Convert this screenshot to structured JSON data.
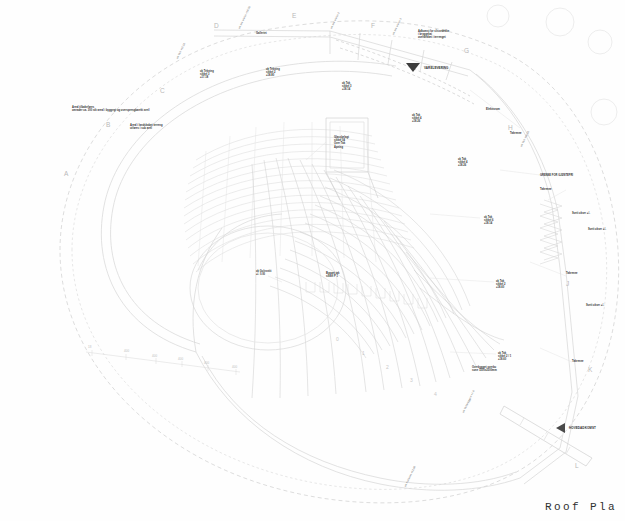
{
  "sheet": {
    "title": "Roof Pla",
    "background": "#fefefe",
    "line_color": "#d9d9d9",
    "line_color_strong": "#bdbdbd",
    "dash_color": "#cfcfcf",
    "text_color": "#2e2e2e"
  },
  "grid_letters": [
    {
      "label": "A",
      "x": 64,
      "y": 170
    },
    {
      "label": "B",
      "x": 106,
      "y": 121
    },
    {
      "label": "C",
      "x": 160,
      "y": 87
    },
    {
      "label": "D",
      "x": 214,
      "y": 22
    },
    {
      "label": "E",
      "x": 292,
      "y": 12
    },
    {
      "label": "F",
      "x": 371,
      "y": 22
    },
    {
      "label": "G",
      "x": 464,
      "y": 47
    },
    {
      "label": "H",
      "x": 508,
      "y": 124
    },
    {
      "label": "J",
      "x": 566,
      "y": 280
    },
    {
      "label": "K",
      "x": 588,
      "y": 366
    },
    {
      "label": "L",
      "x": 575,
      "y": 462
    }
  ],
  "seat_numbers": [
    {
      "label": "0",
      "x": 336,
      "y": 336
    },
    {
      "label": "1",
      "x": 362,
      "y": 350
    },
    {
      "label": "2",
      "x": 386,
      "y": 364
    },
    {
      "label": "3",
      "x": 410,
      "y": 377
    },
    {
      "label": "4",
      "x": 434,
      "y": 391
    }
  ],
  "tick_numbers": [
    {
      "label": "18",
      "x": 88,
      "y": 346
    },
    {
      "label": "400",
      "x": 124,
      "y": 350
    },
    {
      "label": "400",
      "x": 152,
      "y": 355
    },
    {
      "label": "400",
      "x": 178,
      "y": 358
    },
    {
      "label": "400",
      "x": 204,
      "y": 362
    },
    {
      "label": "400",
      "x": 232,
      "y": 366
    }
  ],
  "annotations": [
    {
      "id": "roof-note-c1",
      "x": 200,
      "y": 70,
      "text": "uk Tekning\nsikkel 3\n+17.18",
      "style": "note"
    },
    {
      "id": "roof-note-c2",
      "x": 266,
      "y": 68,
      "text": "uk Tekning\nsikkel 2\n+18.80",
      "style": "note"
    },
    {
      "id": "roof-note-f1",
      "x": 342,
      "y": 82,
      "text": "ok Tak\nsikkel 3\n+18.14",
      "style": "note"
    },
    {
      "id": "roof-note-g1",
      "x": 412,
      "y": 114,
      "text": "ok Tak\nsikkel 4\n+18.26",
      "style": "note"
    },
    {
      "id": "roof-note-g2",
      "x": 458,
      "y": 158,
      "text": "ok Tak\nsikkel 4\n+18.26",
      "style": "note"
    },
    {
      "id": "roof-note-j1",
      "x": 484,
      "y": 216,
      "text": "ok Tak\nsikkel 6\n+18.14",
      "style": "note"
    },
    {
      "id": "roof-note-j2",
      "x": 496,
      "y": 280,
      "text": "ok Tak\nsikkel 2\n+18.60",
      "style": "note"
    },
    {
      "id": "roof-note-k1",
      "x": 498,
      "y": 352,
      "text": "ok Tak\nsikkel 2 / 1\n+18.60",
      "style": "note"
    },
    {
      "id": "site-note-left",
      "x": 72,
      "y": 106,
      "text": "Areal tilbakeføres\nomrader ca. 300 stk areal i byggegt og oversprengbarekt areil",
      "style": "note"
    },
    {
      "id": "site-note-left2",
      "x": 130,
      "y": 124,
      "text": "Areal i landskabet terreng\nutføres i sub areil",
      "style": "note"
    },
    {
      "id": "roof-box-note",
      "x": 334,
      "y": 136,
      "text": "Glassbelagt\nsikkel 04\nOver Tak\nÅpning",
      "style": "note"
    },
    {
      "id": "center-note",
      "x": 256,
      "y": 270,
      "text": "ok Gulvsnitt\n+/- 0.00",
      "style": "note"
    },
    {
      "id": "stage-note",
      "x": 326,
      "y": 272,
      "text": "Bygget tak\nsikkel P 1",
      "style": "note"
    },
    {
      "id": "gjeste-note",
      "x": 540,
      "y": 174,
      "text": "GRENSE FOR GJØSTEFRI",
      "style": "note"
    },
    {
      "id": "takrenne-1",
      "x": 510,
      "y": 132,
      "text": "Takrenne",
      "style": "note"
    },
    {
      "id": "takrenne-2",
      "x": 540,
      "y": 188,
      "text": "Takrenne",
      "style": "note"
    },
    {
      "id": "takrenne-3",
      "x": 566,
      "y": 272,
      "text": "Takrenne",
      "style": "note"
    },
    {
      "id": "takrenne-4",
      "x": 572,
      "y": 360,
      "text": "Takrenne",
      "style": "note"
    },
    {
      "id": "sveit-1",
      "x": 572,
      "y": 212,
      "text": "Sveit okser +/-",
      "style": "note"
    },
    {
      "id": "sveit-2",
      "x": 588,
      "y": 228,
      "text": "Sveit okser +/-",
      "style": "note"
    },
    {
      "id": "sveit-3",
      "x": 586,
      "y": 304,
      "text": "Sveit okser +/-",
      "style": "note"
    },
    {
      "id": "overbygget",
      "x": 472,
      "y": 366,
      "text": "Overbygget overbu\nsone 1500x2500mm",
      "style": "note"
    },
    {
      "id": "galleri-note",
      "x": 256,
      "y": 32,
      "text": "Galleriet",
      "style": "note"
    },
    {
      "id": "elevator-note",
      "x": 486,
      "y": 108,
      "text": "Elektrorom",
      "style": "note"
    },
    {
      "id": "adkomst-note",
      "x": 418,
      "y": 30,
      "text": "Adkomst for slissedekke\ni bryggekai\noverdekket i terrenget",
      "style": "note"
    }
  ],
  "vertical_labels": [
    {
      "id": "v-left-1",
      "x": 176,
      "y": 58,
      "text": "ok Tak +17.10"
    },
    {
      "id": "v-d-1",
      "x": 238,
      "y": 28,
      "text": "ok tak sikkel +18.70"
    },
    {
      "id": "v-f-1",
      "x": 330,
      "y": 28,
      "text": "ok tak sikkel 2"
    },
    {
      "id": "v-f-2",
      "x": 392,
      "y": 34,
      "text": "ok tak sikkel 3"
    },
    {
      "id": "v-h-1",
      "x": 520,
      "y": 146,
      "text": "ok Tak +18.20"
    },
    {
      "id": "v-k-1",
      "x": 462,
      "y": 412,
      "text": "ok Takbryggen +/- 0"
    },
    {
      "id": "v-bottom-1",
      "x": 404,
      "y": 486,
      "text": "ok Fallkant +12.00"
    }
  ],
  "arrow_markers": [
    {
      "id": "varelevering",
      "label": "VARELEVERING",
      "x": 406,
      "y": 58,
      "dir": "down"
    },
    {
      "id": "hovedadkomst",
      "label": "HOVEDADKOMST",
      "x": 556,
      "y": 418,
      "dir": "left"
    }
  ]
}
